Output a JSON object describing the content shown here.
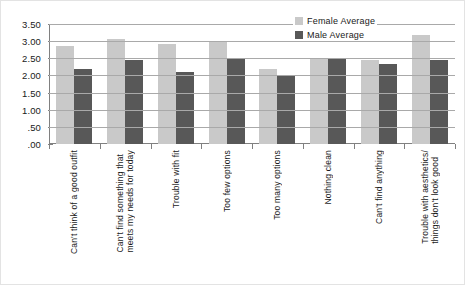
{
  "chart_data": {
    "type": "bar",
    "title": "",
    "subtitle": "",
    "xlabel": "",
    "ylabel": "",
    "ylim": [
      0,
      3.5
    ],
    "ytick_values": [
      3.5,
      3.0,
      2.5,
      2.0,
      1.5,
      1.0,
      0.5,
      0.0
    ],
    "ytick_labels": [
      "3.50",
      "3.00",
      "2.50",
      "2.00",
      "1.50",
      "1.00",
      ".50",
      ".00"
    ],
    "grid": true,
    "legend_position": "top-right",
    "categories": [
      "Can't think of a good outfit",
      "Can't find something that\nmeets my needs for today",
      "Trouble with fit",
      "Too few options",
      "Too many options",
      "Nothing clean",
      "Can't find anything",
      "Trouble with aesthetics/\nthings don't look good"
    ],
    "series": [
      {
        "name": "Female Average",
        "color": "#c9c9c9",
        "values": [
          2.85,
          3.05,
          2.92,
          3.0,
          2.18,
          2.47,
          2.45,
          3.18
        ]
      },
      {
        "name": "Male Average",
        "color": "#585858",
        "values": [
          2.18,
          2.45,
          2.1,
          2.48,
          2.0,
          2.47,
          2.32,
          2.45
        ]
      }
    ]
  },
  "legend": {
    "items": [
      {
        "label": "Female Average"
      },
      {
        "label": "Male Average"
      }
    ]
  },
  "colors": {
    "female": "#c9c9c9",
    "male": "#585858",
    "axis": "#808080",
    "gridline": "#a9a9a9",
    "text": "#1a1a1a",
    "background": "#ffffff"
  }
}
